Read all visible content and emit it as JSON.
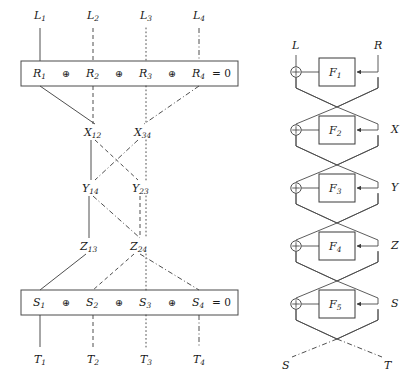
{
  "figure": {
    "colors": {
      "wire": "#3b3b3b",
      "box_border": "#4a4a4a",
      "text": "#1a1a1a",
      "background": "#ffffff"
    }
  },
  "left_panel": {
    "top_inputs": [
      {
        "label": "L",
        "sub": "1",
        "style": "solid"
      },
      {
        "label": "L",
        "sub": "2",
        "style": "dashed"
      },
      {
        "label": "L",
        "sub": "3",
        "style": "dotted"
      },
      {
        "label": "L",
        "sub": "4",
        "style": "dashdot"
      }
    ],
    "top_equation": {
      "terms": [
        {
          "label": "R",
          "sub": "1"
        },
        {
          "label": "R",
          "sub": "2"
        },
        {
          "label": "R",
          "sub": "3"
        },
        {
          "label": "R",
          "sub": "4"
        }
      ],
      "operator": "⊕",
      "result": "= 0"
    },
    "level_x": [
      {
        "label": "X",
        "sub": "12"
      },
      {
        "label": "X",
        "sub": "34"
      }
    ],
    "level_y": [
      {
        "label": "Y",
        "sub": "14"
      },
      {
        "label": "Y",
        "sub": "23"
      }
    ],
    "level_z": [
      {
        "label": "Z",
        "sub": "13"
      },
      {
        "label": "Z",
        "sub": "24"
      }
    ],
    "bottom_equation": {
      "terms": [
        {
          "label": "S",
          "sub": "1"
        },
        {
          "label": "S",
          "sub": "2"
        },
        {
          "label": "S",
          "sub": "3"
        },
        {
          "label": "S",
          "sub": "4"
        }
      ],
      "operator": "⊕",
      "result": "= 0"
    },
    "bottom_outputs": [
      {
        "label": "T",
        "sub": "1",
        "style": "solid"
      },
      {
        "label": "T",
        "sub": "2",
        "style": "dashed"
      },
      {
        "label": "T",
        "sub": "3",
        "style": "dotted"
      },
      {
        "label": "T",
        "sub": "4",
        "style": "dashdot"
      }
    ]
  },
  "right_panel": {
    "top_labels": {
      "left": "L",
      "right": "R"
    },
    "rounds": [
      {
        "function": "F",
        "sub": "1",
        "right_label": ""
      },
      {
        "function": "F",
        "sub": "2",
        "right_label": "X"
      },
      {
        "function": "F",
        "sub": "3",
        "right_label": "Y"
      },
      {
        "function": "F",
        "sub": "4",
        "right_label": "Z"
      },
      {
        "function": "F",
        "sub": "5",
        "right_label": "S"
      }
    ],
    "bottom_labels": {
      "left": "S",
      "right": "T"
    },
    "xor_symbol": "⊕"
  }
}
